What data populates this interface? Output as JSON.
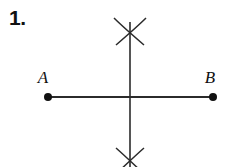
{
  "figure": {
    "problem_number": "1.",
    "title_present": false,
    "background_color": "#ffffff",
    "ink_color": "#1a1a1a",
    "width": 229,
    "height": 167,
    "construction_type": "perpendicular-bisector"
  },
  "labels": {
    "point_a": "A",
    "point_b": "B"
  },
  "geometry": {
    "segment_ab": {
      "x1": 48,
      "y1": 97,
      "x2": 213,
      "y2": 97
    },
    "endpoint_a": {
      "cx": 48,
      "cy": 97,
      "r": 4
    },
    "endpoint_b": {
      "cx": 213,
      "cy": 97,
      "r": 4
    },
    "perpendicular_line": {
      "x1": 130,
      "y1": 22,
      "x2": 130,
      "y2": 167
    },
    "arc_intersection_top": {
      "cx": 130,
      "cy": 32
    },
    "arc_intersection_bottom": {
      "cx": 130,
      "cy": 162
    },
    "label_a_position": {
      "x": 43,
      "y": 83
    },
    "label_b_position": {
      "x": 208,
      "y": 83
    }
  }
}
